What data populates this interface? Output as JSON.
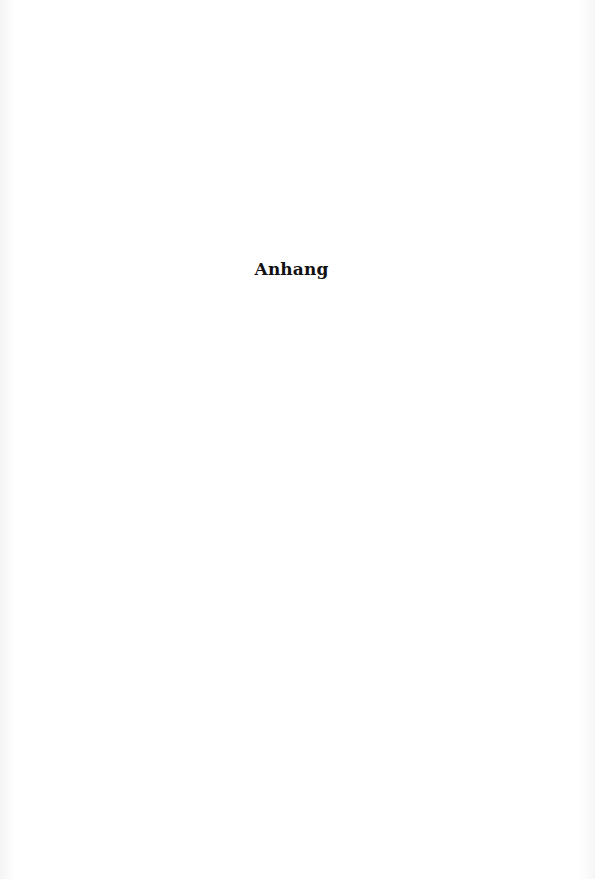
{
  "page": {
    "heading": "Anhang"
  }
}
